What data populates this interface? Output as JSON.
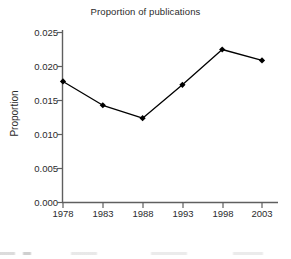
{
  "chart_data": {
    "type": "line",
    "title": "Proportion of publications",
    "xlabel": "Publication year",
    "ylabel": "Proportion",
    "x": [
      1978,
      1983,
      1988,
      1993,
      1998,
      2003
    ],
    "xtick_labels": [
      "1978",
      "1983",
      "1988",
      "1993",
      "1998",
      "2003"
    ],
    "values": [
      0.0178,
      0.0143,
      0.0124,
      0.0173,
      0.0225,
      0.0209
    ],
    "ytick_labels": [
      "0.000",
      "0.005",
      "0.010",
      "0.015",
      "0.020",
      "0.025"
    ],
    "ytick_values": [
      0.0,
      0.005,
      0.01,
      0.015,
      0.02,
      0.025
    ],
    "ylim": [
      0.0,
      0.025
    ],
    "xlim": [
      1978,
      2003
    ],
    "grid": false,
    "legend": "none",
    "series_color": "#000000",
    "marker": "diamond",
    "axis_color": "#595959"
  }
}
